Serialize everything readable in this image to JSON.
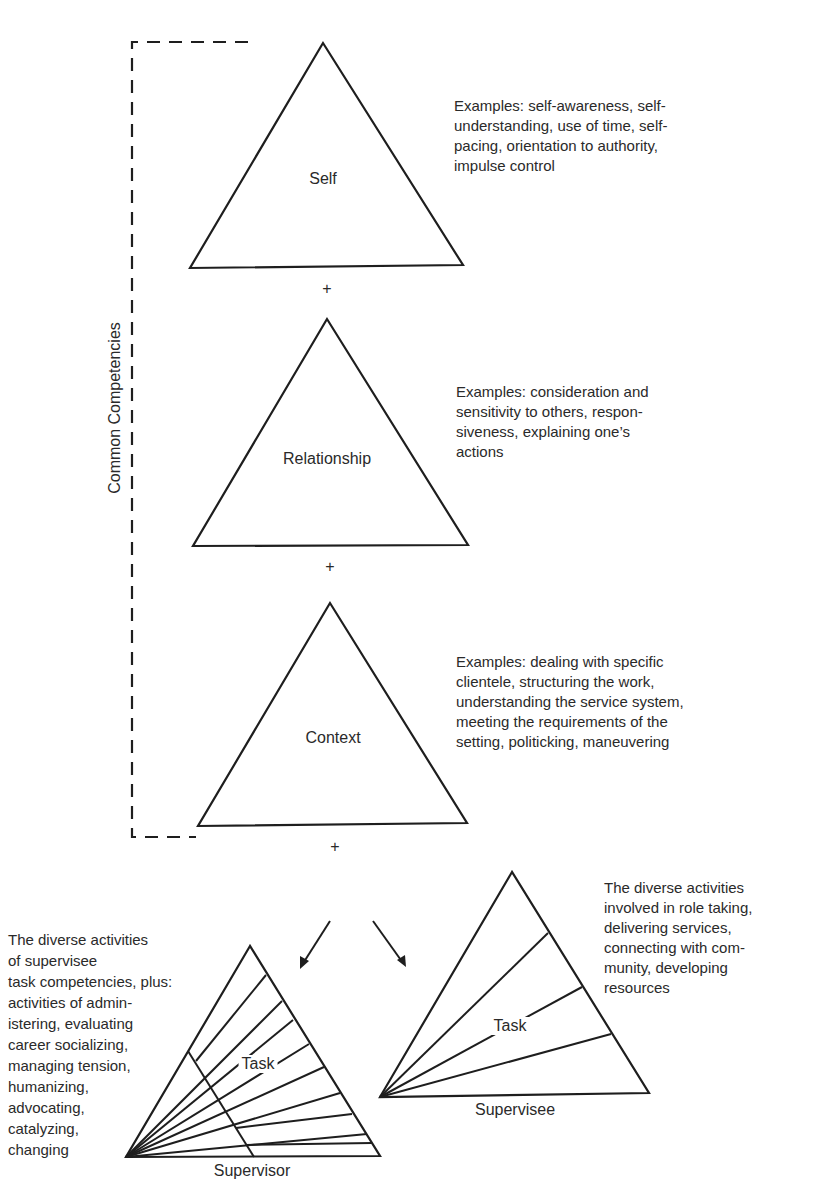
{
  "diagram": {
    "bracket_label": "Common Competencies",
    "plus_sign": "+",
    "common": [
      {
        "name": "Self",
        "examples": [
          "Examples: self-awareness, self-",
          "understanding, use of time, self-",
          "pacing, orientation to authority,",
          "impulse control"
        ]
      },
      {
        "name": "Relationship",
        "examples": [
          "Examples: consideration and",
          "sensitivity to others, respon-",
          "siveness, explaining one’s",
          "actions"
        ]
      },
      {
        "name": "Context",
        "examples": [
          "Examples: dealing with specific",
          "clientele, structuring the work,",
          "understanding the service system,",
          "meeting the requirements of the",
          "setting, politicking, maneuvering"
        ]
      }
    ],
    "supervisor": {
      "inner_label": "Task",
      "base_label": "Supervisor",
      "description": [
        "The diverse activities",
        "of supervisee",
        "task competencies, plus:",
        "activities of admin-",
        "istering, evaluating",
        "career socializing,",
        "managing tension,",
        "humanizing,",
        "advocating,",
        "catalyzing,",
        "changing"
      ]
    },
    "supervisee": {
      "inner_label": "Task",
      "base_label": "Supervisee",
      "description": [
        "The diverse activities",
        "involved in role taking,",
        "delivering services,",
        "connecting with com-",
        "munity, developing",
        "resources"
      ]
    },
    "colors": {
      "line": "#1e1e1e",
      "text": "#2a2a2a",
      "background": "#ffffff"
    }
  }
}
